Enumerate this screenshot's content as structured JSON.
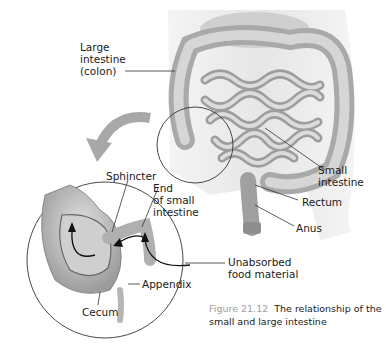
{
  "figure": {
    "number": "Figure 21.12",
    "caption": "The relationship of the small and large intestine"
  },
  "labels": {
    "large_intestine": [
      "Large",
      "intestine",
      "(colon)"
    ],
    "small_intestine": [
      "Small",
      "intestine"
    ],
    "rectum": "Rectum",
    "anus": "Anus",
    "sphincter": "Sphincter",
    "end_small_intestine": [
      "End",
      "of small",
      "intestine"
    ],
    "unabsorbed": [
      "Unabsorbed",
      "food material"
    ],
    "appendix": "Appendix",
    "cecum": "Cecum"
  },
  "colors": {
    "background": "#ffffff",
    "body_silhouette": "#ececec",
    "intestine": "#b8b8b8",
    "intestine_shade": "#8a8a8a",
    "arrow": "#a8a8a8",
    "caption_figure": "#9e9e9e",
    "text": "#1a1a1a"
  }
}
